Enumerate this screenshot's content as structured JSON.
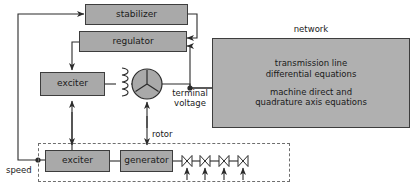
{
  "diagram": {
    "colors": {
      "block_fill": "#a9a9a9",
      "network_fill": "#b0b0b0",
      "stroke": "#3d3d3d",
      "dashed_stroke": "#6e6e6e",
      "background": "#ffffff",
      "text": "#1a1a1a"
    }
  },
  "blocks": {
    "stabilizer": {
      "label": "stabilizer"
    },
    "regulator": {
      "label": "regulator"
    },
    "exciter_top": {
      "label": "exciter"
    },
    "exciter_bottom": {
      "label": "exciter"
    },
    "generator": {
      "label": "generator"
    },
    "network": {
      "title": "network",
      "line1": "transmission line",
      "line2": "differential equations",
      "line3": "machine direct and",
      "line4": "quadrature axis equations"
    }
  },
  "labels": {
    "terminal_voltage_line1": "terminal",
    "terminal_voltage_line2": "voltage",
    "rotor": "rotor",
    "speed": "speed"
  },
  "symbols": {
    "field_winding": "coil-3-loops",
    "machine": "three-phase-wye-circle",
    "turbine_stages": 4
  }
}
